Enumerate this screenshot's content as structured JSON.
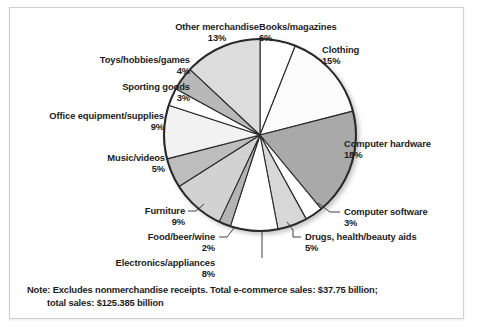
{
  "chart_data": {
    "type": "pie",
    "title": "",
    "subtitle": "",
    "xlabel": "",
    "ylabel": "",
    "legend_position": "callout-labels",
    "grid": false,
    "start_angle_deg": 0,
    "direction": "clockwise",
    "unit": "percent",
    "categories": [
      "Books/magazines",
      "Clothing",
      "Computer hardware",
      "Computer software",
      "Drugs, health/beauty aids",
      "Electronics/appliances",
      "Food/beer/wine",
      "Furniture",
      "Music/videos",
      "Office equipment/supplies",
      "Sporting goods",
      "Toys/hobbies/games",
      "Other merchandise"
    ],
    "values": [
      6,
      15,
      18,
      3,
      5,
      8,
      2,
      9,
      5,
      9,
      3,
      4,
      13
    ],
    "slice_colors": [
      "#ffffff",
      "#fbfbfb",
      "#a9a9a9",
      "#ffffff",
      "#d7d7d7",
      "#ffffff",
      "#b4b4b4",
      "#d2d2d2",
      "#bdbdbd",
      "#f2f2f2",
      "#ffffff",
      "#b8b8b8",
      "#dcdcdc"
    ],
    "slice_labels": [
      "6%",
      "15%",
      "18%",
      "3%",
      "5%",
      "8%",
      "2%",
      "9%",
      "5%",
      "9%",
      "3%",
      "4%",
      "13%"
    ]
  },
  "labels": {
    "books": {
      "name": "Books/magazines",
      "pct": "6%"
    },
    "clothing": {
      "name": "Clothing",
      "pct": "15%"
    },
    "computer_hardware": {
      "name": "Computer hardware",
      "pct": "18%"
    },
    "computer_software": {
      "name": "Computer software",
      "pct": "3%"
    },
    "drugs": {
      "name": "Drugs, health/beauty aids",
      "pct": "5%"
    },
    "electronics": {
      "name": "Electronics/appliances",
      "pct": "8%"
    },
    "food": {
      "name": "Food/beer/wine",
      "pct": "2%"
    },
    "furniture": {
      "name": "Furniture",
      "pct": "9%"
    },
    "music": {
      "name": "Music/videos",
      "pct": "5%"
    },
    "office": {
      "name": "Office equipment/supplies",
      "pct": "9%"
    },
    "sporting": {
      "name": "Sporting goods",
      "pct": "3%"
    },
    "toys": {
      "name": "Toys/hobbies/games",
      "pct": "4%"
    },
    "other": {
      "name": "Other merchandise",
      "pct": "13%"
    }
  },
  "note": {
    "line1": "Note: Excludes nonmerchandise receipts. Total e-commerce sales: $37.75 billion;",
    "line2": "total sales: $125.385 billion"
  },
  "colors": {
    "outline": "#2b2b2b",
    "text": "#1d1d1d",
    "frame_border": "#cfcfcf",
    "background": "#ffffff"
  }
}
